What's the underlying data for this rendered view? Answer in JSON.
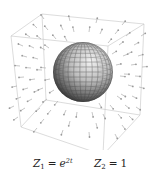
{
  "figure": {
    "sphere_color": "#8a8a8a",
    "arrow_color": "#b8b8b8",
    "box_color": "#c8c8c8"
  },
  "caption": {
    "z1": {
      "symbol": "Z",
      "subscript": "1",
      "relation": "=",
      "base": "e",
      "exponent": "2t"
    },
    "z2": {
      "symbol": "Z",
      "subscript": "2",
      "relation": "=",
      "value": "1"
    }
  }
}
